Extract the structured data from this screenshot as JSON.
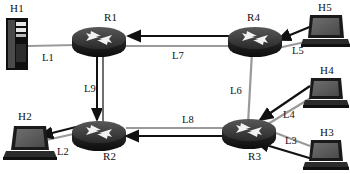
{
  "diagram": {
    "background_color": "#ffffff",
    "link_line_color": "#9a9a9a",
    "path_line_color": "#1a1a1a",
    "router_body_color": "#1c1c1c",
    "router_top_color": "#3d3d3d",
    "device_color": "#555555"
  },
  "nodes": [
    {
      "id": "H1",
      "label": "H1",
      "type": "server-tower",
      "label_x": 10,
      "label_y": 5,
      "icon_x": 6,
      "icon_y": 18,
      "icon_w": 22,
      "icon_h": 52
    },
    {
      "id": "H2",
      "label": "H2",
      "type": "laptop",
      "label_x": 18,
      "label_y": 113,
      "icon_x": 10,
      "icon_y": 126,
      "icon_w": 44,
      "icon_h": 34
    },
    {
      "id": "H3",
      "label": "H3",
      "type": "laptop",
      "label_x": 320,
      "label_y": 128,
      "icon_x": 308,
      "icon_y": 140,
      "icon_w": 38,
      "icon_h": 30
    },
    {
      "id": "H4",
      "label": "H4",
      "type": "laptop",
      "label_x": 320,
      "label_y": 66,
      "icon_x": 308,
      "icon_y": 78,
      "icon_w": 38,
      "icon_h": 30
    },
    {
      "id": "H5",
      "label": "H5",
      "type": "laptop",
      "label_x": 320,
      "label_y": 3,
      "icon_x": 306,
      "icon_y": 15,
      "icon_w": 40,
      "icon_h": 32
    },
    {
      "id": "R1",
      "label": "R1",
      "type": "router",
      "label_x": 104,
      "label_y": 13,
      "icon_x": 72,
      "icon_y": 26,
      "icon_w": 54,
      "icon_h": 30
    },
    {
      "id": "R2",
      "label": "R2",
      "type": "router",
      "label_x": 104,
      "label_y": 152,
      "icon_x": 72,
      "icon_y": 120,
      "icon_w": 54,
      "icon_h": 30
    },
    {
      "id": "R3",
      "label": "R3",
      "type": "router",
      "label_x": 248,
      "label_y": 152,
      "icon_x": 222,
      "icon_y": 118,
      "icon_w": 54,
      "icon_h": 30
    },
    {
      "id": "R4",
      "label": "R4",
      "type": "router",
      "label_x": 248,
      "label_y": 13,
      "icon_x": 228,
      "icon_y": 26,
      "icon_w": 54,
      "icon_h": 30
    }
  ],
  "links": [
    {
      "id": "L1",
      "label": "L1",
      "from": "H1",
      "to": "R1",
      "style": "plain",
      "label_x": 42,
      "label_y": 55
    },
    {
      "id": "L2",
      "label": "L2",
      "from": "R2",
      "to": "H2",
      "style": "arrow",
      "label_x": 57,
      "label_y": 150
    },
    {
      "id": "L3",
      "label": "L3",
      "from": "H3",
      "to": "R3",
      "style": "arrow",
      "label_x": 285,
      "label_y": 139
    },
    {
      "id": "L4",
      "label": "L4",
      "from": "H4",
      "to": "R3",
      "style": "arrow",
      "label_x": 283,
      "label_y": 113
    },
    {
      "id": "L5",
      "label": "L5",
      "from": "H5",
      "to": "R4",
      "style": "arrow",
      "label_x": 293,
      "label_y": 49
    },
    {
      "id": "L6",
      "label": "L6",
      "from": "R4",
      "to": "R3",
      "style": "plain",
      "label_x": 230,
      "label_y": 88
    },
    {
      "id": "L7",
      "label": "L7",
      "from": "R4",
      "to": "R1",
      "style": "arrow",
      "label_x": 172,
      "label_y": 53
    },
    {
      "id": "L8",
      "label": "L8",
      "from": "R3",
      "to": "R2",
      "style": "arrow",
      "label_x": 182,
      "label_y": 118
    },
    {
      "id": "L9",
      "label": "L9",
      "from": "R1",
      "to": "R2",
      "style": "arrow",
      "label_x": 86,
      "label_y": 86
    }
  ]
}
